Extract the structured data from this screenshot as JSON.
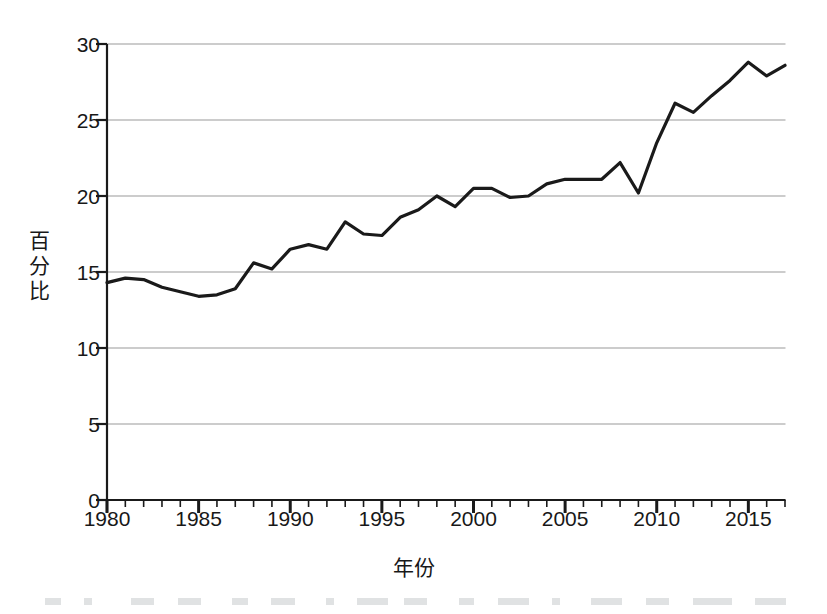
{
  "chart_data": {
    "type": "line",
    "title": "",
    "xlabel": "年份",
    "ylabel": "百分比",
    "xlim": [
      1980,
      2017
    ],
    "ylim": [
      0,
      30
    ],
    "grid": "horizontal",
    "legend": "none",
    "x_tick_labels": [
      "1980",
      "1985",
      "1990",
      "1995",
      "2000",
      "2005",
      "2010",
      "2015"
    ],
    "x_tick_values": [
      1980,
      1985,
      1990,
      1995,
      2000,
      2005,
      2010,
      2015
    ],
    "x_minor_tick_interval": 1,
    "y_tick_labels": [
      "0",
      "5",
      "10",
      "15",
      "20",
      "25",
      "30"
    ],
    "y_tick_values": [
      0,
      5,
      10,
      15,
      20,
      25,
      30
    ],
    "line_color": "#1a1a1a",
    "grid_color": "#9a9a9a",
    "x": [
      1980,
      1981,
      1982,
      1983,
      1984,
      1985,
      1986,
      1987,
      1988,
      1989,
      1990,
      1991,
      1992,
      1993,
      1994,
      1995,
      1996,
      1997,
      1998,
      1999,
      2000,
      2001,
      2002,
      2003,
      2004,
      2005,
      2006,
      2007,
      2008,
      2009,
      2010,
      2011,
      2012,
      2013,
      2014,
      2015,
      2016,
      2017
    ],
    "values": [
      14.3,
      14.6,
      14.5,
      14.0,
      13.7,
      13.4,
      13.5,
      13.9,
      15.6,
      15.2,
      16.5,
      16.8,
      16.5,
      18.3,
      17.5,
      17.4,
      18.6,
      19.1,
      20.0,
      19.3,
      20.5,
      20.5,
      19.9,
      20.0,
      20.8,
      21.1,
      21.1,
      21.1,
      22.2,
      20.2,
      23.5,
      26.1,
      25.5,
      26.6,
      27.6,
      28.8,
      27.9,
      28.6
    ],
    "series": [
      {
        "name": "百分比",
        "values": [
          14.3,
          14.6,
          14.5,
          14.0,
          13.7,
          13.4,
          13.5,
          13.9,
          15.6,
          15.2,
          16.5,
          16.8,
          16.5,
          18.3,
          17.5,
          17.4,
          18.6,
          19.1,
          20.0,
          19.3,
          20.5,
          20.5,
          19.9,
          20.0,
          20.8,
          21.1,
          21.1,
          21.1,
          22.2,
          20.2,
          23.5,
          26.1,
          25.5,
          26.6,
          27.6,
          28.8,
          27.9,
          28.6
        ]
      }
    ]
  }
}
